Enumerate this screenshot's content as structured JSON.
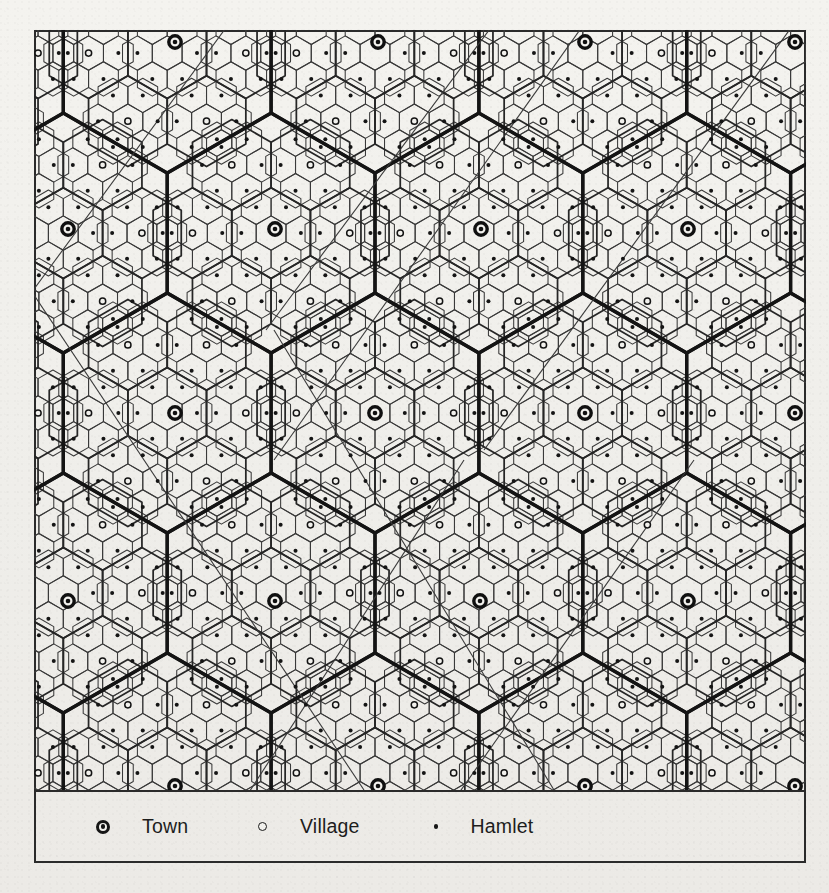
{
  "figure": {
    "kind": "central-place-hierarchy-map",
    "background_color": "#f2f1ed",
    "ink_color": "#222222"
  },
  "legend": {
    "items": [
      {
        "symbol": "town-symbol",
        "label": "Town",
        "x": 103,
        "text_x": 143
      },
      {
        "symbol": "village-symbol",
        "label": "Village",
        "x": 262,
        "text_x": 300
      },
      {
        "symbol": "hamlet-symbol",
        "label": "Hamlet",
        "x": 436,
        "text_x": 470
      }
    ]
  },
  "chart_data": {
    "type": "map",
    "title": "",
    "frame": {
      "x": 34,
      "y": 30,
      "width": 772,
      "height": 833,
      "map_height": 760
    },
    "hierarchy": [
      {
        "level": "town",
        "hex_radius": 120.0,
        "line_width": 3.2,
        "marker": "circle-with-dot"
      },
      {
        "level": "village",
        "hex_radius": 45.4,
        "line_width": 1.6,
        "marker": "open-circle"
      },
      {
        "level": "hamlet",
        "hex_radius": 17.2,
        "line_width": 1.0,
        "marker": "dot"
      }
    ],
    "lattice": {
      "town_spacing_x": 207.8,
      "town_spacing_y": 359.9,
      "row_offset_x": 103.9,
      "orientation": "pointy-top"
    },
    "town_positions": [
      [
        175,
        42
      ],
      [
        378,
        42
      ],
      [
        585,
        42
      ],
      [
        795,
        42
      ],
      [
        68,
        229
      ],
      [
        275,
        229
      ],
      [
        481,
        229
      ],
      [
        688,
        229
      ],
      [
        175,
        413
      ],
      [
        375,
        413
      ],
      [
        585,
        413
      ],
      [
        795,
        413
      ],
      [
        68,
        601
      ],
      [
        275,
        601
      ],
      [
        480,
        601
      ],
      [
        688,
        601
      ],
      [
        175,
        786
      ],
      [
        378,
        786
      ],
      [
        585,
        786
      ],
      [
        795,
        786
      ]
    ],
    "transport_routes": {
      "count": 6,
      "style": "thin straight lines crossing the lattice diagonally"
    }
  }
}
